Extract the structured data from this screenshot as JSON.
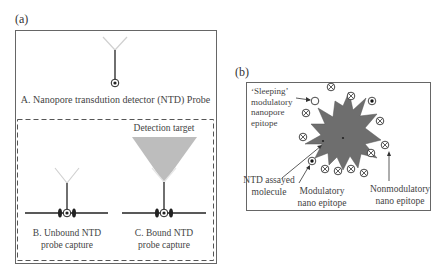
{
  "panel_a": {
    "label": "(a)",
    "probe_a_caption": "A. Nanopore transdution detector (NTD) Probe",
    "detection_target_label": "Detection target",
    "probe_b_caption": [
      "B. Unbound NTD",
      "probe capture"
    ],
    "probe_c_caption": [
      "C. Bound NTD",
      "probe capture"
    ]
  },
  "panel_b": {
    "label": "(b)",
    "sleeping_label": [
      "‘Sleeping’",
      "modulatory",
      "nanopore",
      "epitope"
    ],
    "molecule_label": [
      "NTD assayed",
      "molecule"
    ],
    "modulatory_label": [
      "Modulatory",
      "nano epitope"
    ],
    "nonmodulatory_label": [
      "Nonmodulatory",
      "nano epitope"
    ],
    "epitopes": [
      {
        "type": "sleeping",
        "x": 315,
        "y": 101
      },
      {
        "type": "nonmodulatory",
        "x": 331,
        "y": 87
      },
      {
        "type": "nonmodulatory",
        "x": 351,
        "y": 96
      },
      {
        "type": "modulatory",
        "x": 372,
        "y": 101
      },
      {
        "type": "nonmodulatory",
        "x": 306,
        "y": 113
      },
      {
        "type": "nonmodulatory",
        "x": 380,
        "y": 121
      },
      {
        "type": "nonmodulatory",
        "x": 303,
        "y": 137
      },
      {
        "type": "nonmodulatory",
        "x": 385,
        "y": 145
      },
      {
        "type": "nonmodulatory",
        "x": 371,
        "y": 153
      },
      {
        "type": "modulatory",
        "x": 312,
        "y": 161
      },
      {
        "type": "nonmodulatory",
        "x": 325,
        "y": 169
      },
      {
        "type": "nonmodulatory",
        "x": 338,
        "y": 171
      },
      {
        "type": "nonmodulatory",
        "x": 351,
        "y": 169
      },
      {
        "type": "nonmodulatory",
        "x": 364,
        "y": 173
      }
    ]
  },
  "colors": {
    "line": "#333333",
    "arm": "#d0d0d0",
    "target": "#bdbdbd",
    "molecule": "#6e6e6e",
    "box": "#555555"
  }
}
